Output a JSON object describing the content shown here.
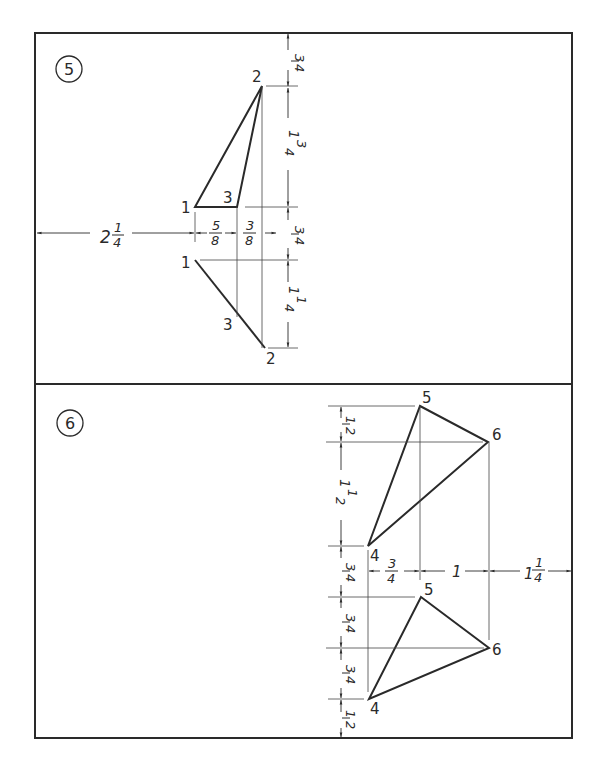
{
  "problems": [
    {
      "number": "5",
      "points": {
        "top_view": [
          {
            "label": "2"
          },
          {
            "label": "1"
          },
          {
            "label": "3"
          }
        ],
        "front_view": [
          {
            "label": "1"
          },
          {
            "label": "3"
          },
          {
            "label": "2"
          }
        ]
      },
      "dimensions": {
        "top_margin": {
          "whole": "",
          "num": "3",
          "den": "4"
        },
        "vertical_top": {
          "whole": "1",
          "num": "3",
          "den": "4"
        },
        "gap_between_views": {
          "whole": "",
          "num": "3",
          "den": "4"
        },
        "vertical_front": {
          "whole": "1",
          "num": "1",
          "den": "4"
        },
        "left_offset": {
          "whole": "2",
          "num": "1",
          "den": "4"
        },
        "horiz_1_to_3": {
          "whole": "",
          "num": "5",
          "den": "8"
        },
        "horiz_3_to_2": {
          "whole": "",
          "num": "3",
          "den": "8"
        }
      }
    },
    {
      "number": "6",
      "points": {
        "top_view": [
          {
            "label": "5"
          },
          {
            "label": "6"
          },
          {
            "label": "4"
          }
        ],
        "front_view": [
          {
            "label": "5"
          },
          {
            "label": "6"
          },
          {
            "label": "4"
          }
        ]
      },
      "dimensions": {
        "v1": {
          "whole": "",
          "num": "1",
          "den": "2"
        },
        "v2": {
          "whole": "1",
          "num": "1",
          "den": "2"
        },
        "v3": {
          "whole": "",
          "num": "3",
          "den": "4"
        },
        "v4": {
          "whole": "",
          "num": "3",
          "den": "4"
        },
        "v5": {
          "whole": "",
          "num": "3",
          "den": "4"
        },
        "v6": {
          "whole": "",
          "num": "1",
          "den": "2"
        },
        "h1": {
          "whole": "",
          "num": "3",
          "den": "4"
        },
        "h2": {
          "whole": "1",
          "num": "",
          "den": ""
        },
        "h3": {
          "whole": "1",
          "num": "1",
          "den": "4"
        }
      }
    }
  ]
}
